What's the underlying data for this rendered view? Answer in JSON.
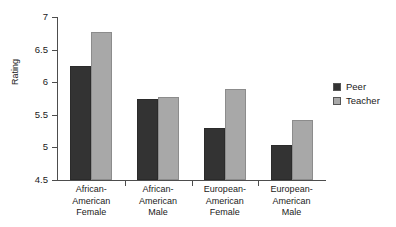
{
  "chart_data": {
    "type": "bar",
    "title": "",
    "xlabel": "",
    "ylabel": "Rating",
    "ylim": [
      4.5,
      7
    ],
    "ytick_labels": [
      "7",
      "6.5",
      "6",
      "5.5",
      "5",
      "4.5"
    ],
    "ytick_values": [
      7,
      6.5,
      6,
      5.5,
      5,
      4.5
    ],
    "grid": false,
    "legend_position": "right",
    "categories": [
      "African-\nAmerican\nFemale",
      "African-\nAmerican\nMale",
      "European-\nAmerican\nFemale",
      "European-\nAmerican\nMale"
    ],
    "series": [
      {
        "name": "Peer",
        "color": "#333333",
        "values": [
          6.25,
          5.75,
          5.3,
          5.03
        ]
      },
      {
        "name": "Teacher",
        "color": "#a8a8a8",
        "values": [
          6.77,
          5.77,
          5.9,
          5.42
        ]
      }
    ]
  },
  "legend": {
    "items": [
      {
        "label": "Peer"
      },
      {
        "label": "Teacher"
      }
    ]
  },
  "colors": {
    "peer": "#333333",
    "teacher": "#a8a8a8",
    "axis": "#4d4d4d",
    "text": "#1a1a1a",
    "background": "#ffffff"
  }
}
